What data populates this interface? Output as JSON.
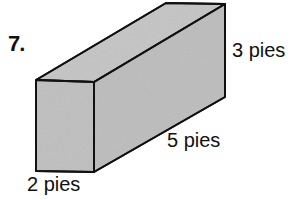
{
  "problem": {
    "number": "7.",
    "shape": "rectangular-prism",
    "labels": {
      "height": "3 pies",
      "length": "5 pies",
      "width": "2 pies"
    },
    "colors": {
      "fill": "#bdbdbd",
      "stroke": "#111111"
    }
  }
}
